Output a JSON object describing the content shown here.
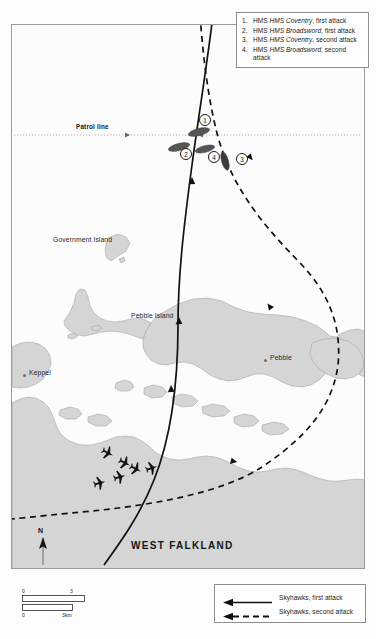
{
  "map": {
    "title_region": "West Falkland / Pebble Island, Falklands War attack map",
    "main_label": "WEST FALKLAND",
    "patrol_line_label": "Patrol line",
    "places": [
      {
        "name": "Government Island",
        "type": "island-label"
      },
      {
        "name": "Pebble Island",
        "type": "island-label"
      },
      {
        "name": "Pebble",
        "type": "settlement"
      },
      {
        "name": "Keppel",
        "type": "settlement"
      }
    ],
    "north_label": "N"
  },
  "ship_legend": {
    "items": [
      {
        "num": "1.",
        "ship": "HMS Coventry",
        "detail": ", first attack"
      },
      {
        "num": "2.",
        "ship": "HMS Broadsword",
        "detail": ", first attack"
      },
      {
        "num": "3.",
        "ship": "HMS Coventry",
        "detail": ", second attack"
      },
      {
        "num": "4.",
        "ship": "HMS Broadsword",
        "detail": ", second attack"
      }
    ]
  },
  "symbol_legend": {
    "items": [
      {
        "label": "Skyhawks, first attack",
        "style": "solid-arrow"
      },
      {
        "label": "Skyhawks, second attack",
        "style": "dashed-arrow"
      }
    ]
  },
  "scale_bar": {
    "miles_start": "0",
    "miles_end": "3 miles",
    "km_start": "0",
    "km_end": "3km"
  },
  "ship_markers": [
    {
      "id": "1",
      "name": "HMS Coventry first attack"
    },
    {
      "id": "2",
      "name": "HMS Broadsword first attack"
    },
    {
      "id": "3",
      "name": "HMS Coventry second attack"
    },
    {
      "id": "4",
      "name": "HMS Broadsword second attack"
    }
  ],
  "colors": {
    "land": "#d4d4d4",
    "land_stroke": "#9b9b9b",
    "sea": "#fcfcfc",
    "track": "#111111",
    "ship": "#4a4a4a",
    "frame": "#9a9a9a"
  }
}
